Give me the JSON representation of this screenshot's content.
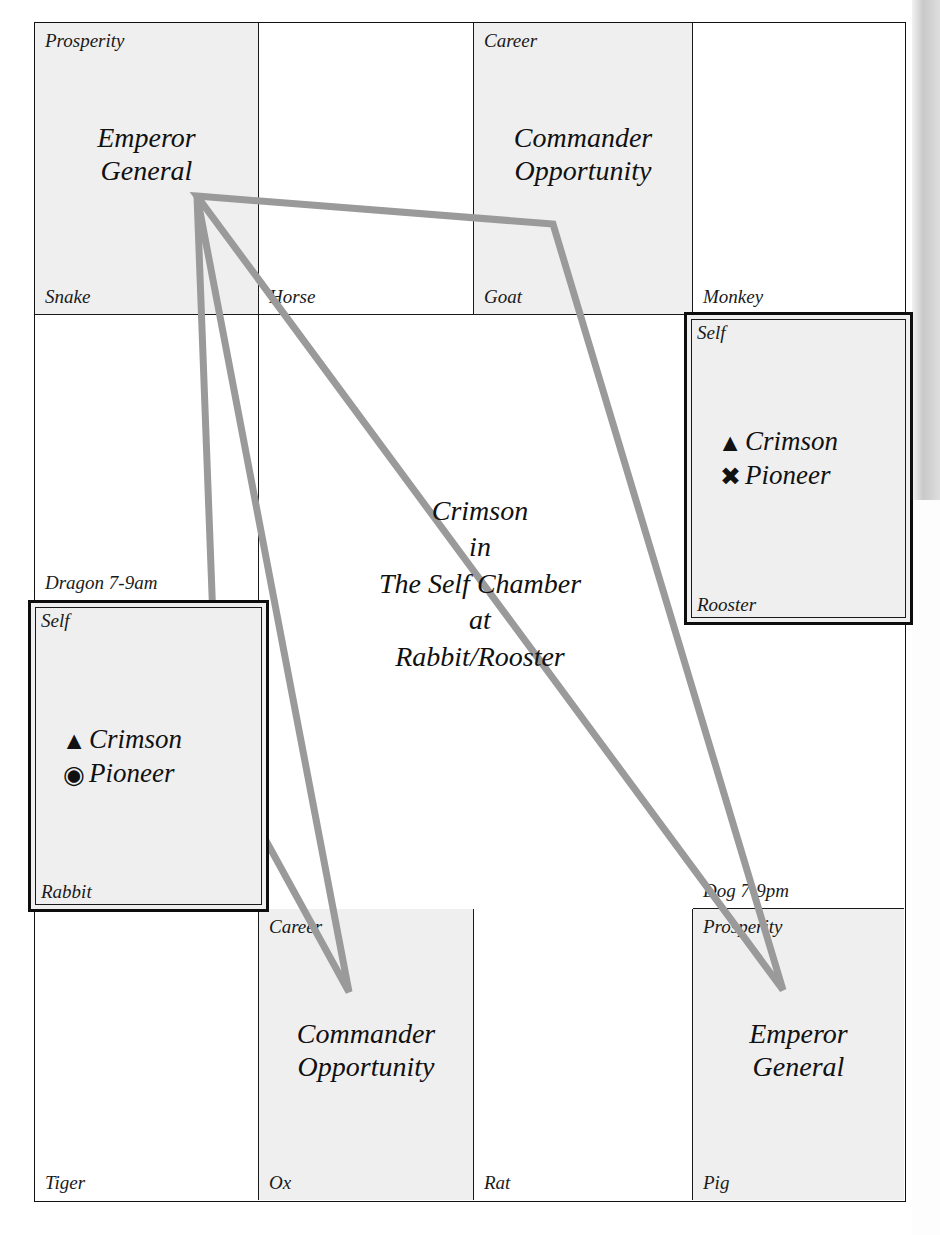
{
  "chart_data": {
    "type": "diagram",
    "center_caption": [
      "Crimson",
      "in",
      "The Self Chamber",
      "at",
      "Rabbit/Rooster"
    ],
    "grid": {
      "rows": 4,
      "cols": 4,
      "cells": [
        {
          "id": "snake",
          "branch": "Snake",
          "palace": "Prosperity",
          "title": [
            "Emperor",
            "General"
          ],
          "shaded": true,
          "highlighted": false
        },
        {
          "id": "horse",
          "branch": "Horse",
          "palace": "",
          "title": [],
          "shaded": false,
          "highlighted": false
        },
        {
          "id": "goat",
          "branch": "Goat",
          "palace": "Career",
          "title": [
            "Commander",
            "Opportunity"
          ],
          "shaded": true,
          "highlighted": false
        },
        {
          "id": "monkey",
          "branch": "Monkey",
          "palace": "",
          "title": [],
          "shaded": false,
          "highlighted": false
        },
        {
          "id": "dragon",
          "branch": "Dragon 7-9am",
          "palace": "",
          "title": [],
          "shaded": false,
          "highlighted": false
        },
        {
          "id": "rooster",
          "branch": "Rooster",
          "palace": "Self",
          "title": [],
          "shaded": true,
          "highlighted": true
        },
        {
          "id": "rabbit",
          "branch": "Rabbit",
          "palace": "Self",
          "title": [],
          "shaded": true,
          "highlighted": true
        },
        {
          "id": "dog",
          "branch": "Dog 7-9pm",
          "palace": "",
          "title": [],
          "shaded": false,
          "highlighted": false
        },
        {
          "id": "tiger",
          "branch": "Tiger",
          "palace": "",
          "title": [],
          "shaded": false,
          "highlighted": false
        },
        {
          "id": "ox",
          "branch": "Ox",
          "palace": "Career",
          "title": [
            "Commander",
            "Opportunity"
          ],
          "shaded": true,
          "highlighted": false
        },
        {
          "id": "rat",
          "branch": "Rat",
          "palace": "",
          "title": [],
          "shaded": false,
          "highlighted": false
        },
        {
          "id": "pig",
          "branch": "Pig",
          "palace": "Prosperity",
          "title": [
            "Emperor",
            "General"
          ],
          "shaded": true,
          "highlighted": false
        }
      ]
    },
    "star_boxes": [
      {
        "id": "rooster-star-box",
        "palace": "Self",
        "branch": "Rooster",
        "stars": [
          {
            "glyph": "▲",
            "glyph_name": "filled-triangle-icon",
            "label": "Crimson"
          },
          {
            "glyph": "✖",
            "glyph_name": "heavy-x-icon",
            "label": "Pioneer"
          }
        ]
      },
      {
        "id": "rabbit-star-box",
        "palace": "Self",
        "branch": "Rabbit",
        "stars": [
          {
            "glyph": "▲",
            "glyph_name": "filled-triangle-icon",
            "label": "Crimson"
          },
          {
            "glyph": "◉",
            "glyph_name": "circled-dot-icon",
            "label": "Pioneer"
          }
        ]
      }
    ],
    "triangles": {
      "color": "#9a9a9a",
      "stroke_width": 7,
      "shapes": [
        {
          "name": "triangle-snake-goat-pig",
          "points": "197,196 553,224 783,990"
        },
        {
          "name": "triangle-snake-rabbit-ox",
          "points": "197,196 218,753 349,992"
        }
      ]
    },
    "colors": {
      "shaded_cell": "#efefef",
      "grid_line": "#1a1a1a",
      "triangle_line": "#9a9a9a",
      "text": "#111111"
    }
  }
}
